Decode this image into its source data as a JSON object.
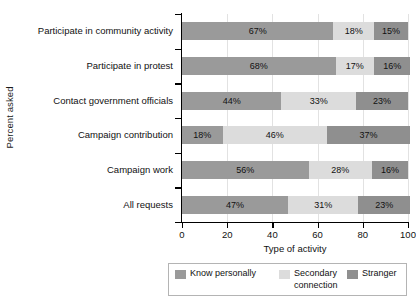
{
  "chart_data": {
    "type": "bar",
    "orientation": "horizontal",
    "stacked": true,
    "stacked_unit": "percent",
    "title": "",
    "xlabel": "Type of activity",
    "ylabel": "Percent asked",
    "xlim": [
      0,
      100
    ],
    "xticks": [
      0,
      20,
      40,
      60,
      80,
      100
    ],
    "xtick_labels": [
      "0",
      "20",
      "40",
      "60",
      "80",
      "100"
    ],
    "grid": "vertical",
    "legend_position": "bottom",
    "categories": [
      "Participate in community activity",
      "Participate in protest",
      "Contact government officials",
      "Campaign contribution",
      "Campaign work",
      "All requests"
    ],
    "series": [
      {
        "name": "Know personally",
        "color": "#9a9a9a",
        "values": [
          67,
          68,
          44,
          18,
          56,
          47
        ],
        "labels": [
          "67%",
          "68%",
          "44%",
          "18%",
          "56%",
          "47%"
        ]
      },
      {
        "name": "Secondary connection",
        "color": "#dcdcdc",
        "values": [
          18,
          17,
          33,
          46,
          28,
          31
        ],
        "labels": [
          "18%",
          "17%",
          "33%",
          "46%",
          "28%",
          "31%"
        ]
      },
      {
        "name": "Stranger",
        "color": "#8f8f8f",
        "values": [
          15,
          16,
          23,
          37,
          16,
          23
        ],
        "labels": [
          "15%",
          "16%",
          "23%",
          "37%",
          "16%",
          "23%"
        ]
      }
    ],
    "legend_entries": [
      {
        "label": "Know personally",
        "line1": "Know personally",
        "line2": "",
        "color": "#9a9a9a"
      },
      {
        "label": "Secondary connection",
        "line1": "Secondary",
        "line2": "connection",
        "color": "#dcdcdc"
      },
      {
        "label": "Stranger",
        "line1": "Stranger",
        "line2": "",
        "color": "#8f8f8f"
      }
    ]
  }
}
